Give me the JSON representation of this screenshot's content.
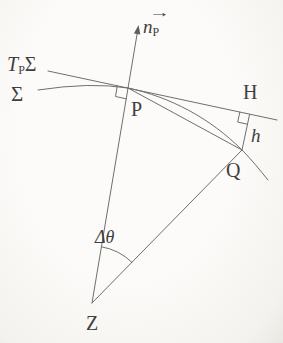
{
  "figure": {
    "background": "#faf9f6",
    "line_color": "#6f6f6f",
    "text_color": "#3f3f3f",
    "labels": {
      "normal_vector": {
        "arrow": "→",
        "base": "n",
        "sub": "P"
      },
      "tangent_plane": {
        "t": "T",
        "sub": "P",
        "sigma": "Σ"
      },
      "surface": "Σ",
      "point_p": "P",
      "point_h": "H",
      "point_q": "Q",
      "point_z": "Z",
      "height": "h",
      "angle": "Δθ"
    }
  }
}
